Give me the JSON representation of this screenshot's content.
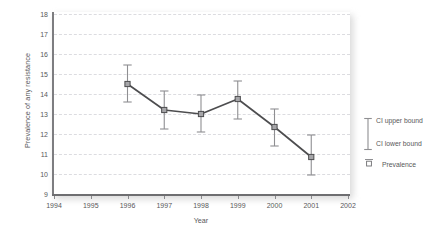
{
  "chart_data": {
    "type": "line",
    "title": "",
    "xlabel": "Year",
    "ylabel": "Prevalence of any resistance",
    "xlim": [
      1994,
      2002
    ],
    "ylim": [
      9,
      18
    ],
    "xticks": [
      "1994",
      "1995",
      "1996",
      "1997",
      "1998",
      "1999",
      "2000",
      "2001",
      "2002"
    ],
    "yticks": [
      "9",
      "10",
      "11",
      "12",
      "13",
      "14",
      "15",
      "16",
      "17",
      "18"
    ],
    "grid": "horizontal-dashed",
    "legend_position": "right",
    "x": [
      1996,
      1997,
      1998,
      1999,
      2000,
      2001
    ],
    "series": [
      {
        "name": "Prevalence",
        "values": [
          14.5,
          13.2,
          13.0,
          13.75,
          12.35,
          10.85
        ],
        "ci_upper": [
          15.45,
          14.15,
          13.95,
          14.65,
          13.25,
          11.95
        ],
        "ci_lower": [
          13.6,
          12.25,
          12.1,
          12.75,
          11.4,
          9.95
        ]
      }
    ],
    "legend": [
      {
        "key": "ci-upper",
        "label": "CI upper bound"
      },
      {
        "key": "ci-lower",
        "label": "CI lower bound"
      },
      {
        "key": "prevalence",
        "label": "Prevalence"
      }
    ],
    "colors": {
      "line": "#4d4d4f",
      "marker_fill": "#a6a6a9",
      "marker_edge": "#4d4d4f",
      "error_bar": "#8f8f92",
      "gridline": "#dcdce0",
      "axis": "#6e6e71",
      "text": "#58585a",
      "background": "#ffffff"
    }
  }
}
